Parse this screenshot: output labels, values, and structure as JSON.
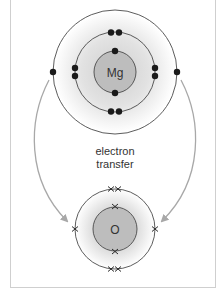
{
  "diagram": {
    "type": "ionic-bonding-electron-transfer",
    "atoms": [
      {
        "symbol": "Mg",
        "shells": [
          2,
          8,
          2
        ],
        "electron_marker": "dot"
      },
      {
        "symbol": "O",
        "shells": [
          2,
          6
        ],
        "electron_marker": "cross"
      }
    ],
    "transfer_label_line1": "electron",
    "transfer_label_line2": "transfer",
    "arrows": [
      {
        "from": "Mg outer electron (left)",
        "to": "O outer shell (left)"
      },
      {
        "from": "Mg outer electron (right)",
        "to": "O outer shell (right)"
      }
    ],
    "colors": {
      "nucleus_fill": "#bdbdbd",
      "shell_glow": "#d6d6d6",
      "line": "#4a4a4a",
      "electron": "#1a1a1a",
      "arrow": "#a8a8a8",
      "frame": "#cfcfcf"
    }
  }
}
